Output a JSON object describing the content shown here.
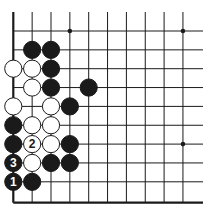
{
  "board": {
    "origin_x": 13.3,
    "origin_y": 31,
    "spacing": 18.85,
    "cols": 10,
    "rows": 10,
    "top_extend_y": 12,
    "right_extend_x": 203,
    "left_edge_x": 13.3,
    "bottom_edge_y": 202.7,
    "line_color": "#1a1a1a",
    "edge_color": "#1a1a1a",
    "stone_radius": 8.6,
    "black_color": "#1a1a1a",
    "white_color": "#ffffff",
    "star_points": [
      {
        "col": 3,
        "row": 0
      },
      {
        "col": 9,
        "row": 0
      },
      {
        "col": 9,
        "row": 6
      }
    ]
  },
  "stones": [
    {
      "color": "black",
      "col": 1,
      "row": 1,
      "label": ""
    },
    {
      "color": "black",
      "col": 2,
      "row": 1,
      "label": ""
    },
    {
      "color": "white",
      "col": 0,
      "row": 2,
      "label": ""
    },
    {
      "color": "white",
      "col": 1,
      "row": 2,
      "label": ""
    },
    {
      "color": "black",
      "col": 2,
      "row": 2,
      "label": ""
    },
    {
      "color": "white",
      "col": 1,
      "row": 3,
      "label": ""
    },
    {
      "color": "black",
      "col": 2,
      "row": 3,
      "label": ""
    },
    {
      "color": "black",
      "col": 4,
      "row": 3,
      "label": ""
    },
    {
      "color": "white",
      "col": 0,
      "row": 4,
      "label": ""
    },
    {
      "color": "white",
      "col": 2,
      "row": 4,
      "label": ""
    },
    {
      "color": "black",
      "col": 3,
      "row": 4,
      "label": ""
    },
    {
      "color": "black",
      "col": 0,
      "row": 5,
      "label": ""
    },
    {
      "color": "white",
      "col": 1,
      "row": 5,
      "label": ""
    },
    {
      "color": "white",
      "col": 2,
      "row": 5,
      "label": ""
    },
    {
      "color": "black",
      "col": 0,
      "row": 6,
      "label": ""
    },
    {
      "color": "white",
      "col": 1,
      "row": 6,
      "label": "2"
    },
    {
      "color": "white",
      "col": 2,
      "row": 6,
      "label": ""
    },
    {
      "color": "black",
      "col": 3,
      "row": 6,
      "label": ""
    },
    {
      "color": "black",
      "col": 0,
      "row": 7,
      "label": "3"
    },
    {
      "color": "white",
      "col": 1,
      "row": 7,
      "label": ""
    },
    {
      "color": "black",
      "col": 2,
      "row": 7,
      "label": ""
    },
    {
      "color": "black",
      "col": 3,
      "row": 7,
      "label": ""
    },
    {
      "color": "black",
      "col": 0,
      "row": 8,
      "label": "1"
    },
    {
      "color": "black",
      "col": 1,
      "row": 8,
      "label": ""
    }
  ],
  "move_labels": [
    "1",
    "2",
    "3"
  ]
}
